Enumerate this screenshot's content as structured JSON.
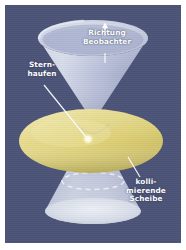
{
  "figure": {
    "kind": "astronomy-schematic-diagram",
    "language": "de"
  },
  "colors": {
    "page_background": "#ffffff",
    "plate_background": "#4b5377",
    "cone_upper_light": "#ccd2e2",
    "cone_upper_dark": "#9ba2c2",
    "cone_lower": "#c5cbe0",
    "disk_yellow_light": "#ece3a0",
    "disk_yellow_mid": "#ded177",
    "disk_yellow_shadow": "#c3b65e",
    "label_text": "#ffffff",
    "leader_line": "#ffffff",
    "star_point": "#fffbe3",
    "dashed_ellipse": "#e7eaf5"
  },
  "labels": [
    {
      "id": "direction-observer",
      "name": "richtung-beobachter",
      "text": "Richtung\nBeobachter",
      "has_arrow": true,
      "arrow_direction": "up",
      "has_leader": true
    },
    {
      "id": "star-cluster",
      "name": "sternhaufen",
      "text": "Stern-\nhaufen",
      "has_arrow": false,
      "has_leader": true
    },
    {
      "id": "collimating-disk",
      "name": "kollimierende-scheibe",
      "text": "kolli-\nmierende\nScheibe",
      "has_arrow": false,
      "has_leader": true
    }
  ],
  "elements": {
    "upper_cone": "bipolarer Ausstroemungskegel nach oben",
    "lower_cone": "bipolarer Ausstroemungskegel nach unten",
    "disk": "kollimierende Scheibe",
    "star_point": "Sternhaufen im Zentrum",
    "dashed_ring": "gestrichelte Ellipse im unteren Kegel"
  }
}
